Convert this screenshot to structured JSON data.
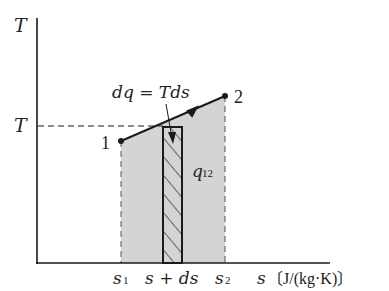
{
  "diagram": {
    "type": "T-s diagram",
    "colors": {
      "ink": "#1a1a1a",
      "area_fill": "#d4d4d4",
      "background": "#ffffff"
    },
    "axes": {
      "y_label": "T",
      "x_label_var": "s",
      "x_label_unit": "〔J/(kg·K)〕"
    },
    "labels": {
      "T_level": "T",
      "point1": "1",
      "point2": "2",
      "equation": "dq = Tds",
      "area": "q",
      "area_sub": "12",
      "s1": "s",
      "s1_sub": "1",
      "s_ds": "s + ds",
      "s2": "s",
      "s2_sub": "2"
    }
  }
}
